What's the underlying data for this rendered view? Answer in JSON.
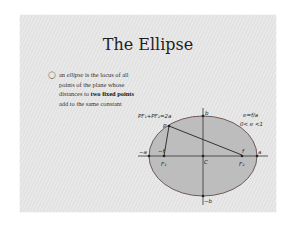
{
  "slide": {
    "title": "The Ellipse",
    "bullet": {
      "icon": "hollow-bullet",
      "text_parts": [
        {
          "t": "an ",
          "style": "normal"
        },
        {
          "t": "ellipse",
          "style": "italic"
        },
        {
          "t": " is the locus of all points of the plane whose distances to ",
          "style": "normal"
        },
        {
          "t": "two fixed points",
          "style": "bold"
        },
        {
          "t": " add to the same constant",
          "style": "normal"
        }
      ]
    },
    "diagram": {
      "formula_sum": "PF₁+PF₂=2a",
      "eccentricity": "e=f/a",
      "ecc_range": "0< e <1",
      "labels": {
        "b": "b",
        "neg_b": "−b",
        "a": "a",
        "neg_a": "−a",
        "f": "f",
        "neg_f": "−f",
        "P": "P",
        "F1": "F₁",
        "F2": "F₂",
        "C": "C"
      },
      "colors": {
        "fill": "#b9b9b9",
        "stroke": "#6e5a5a",
        "line": "#333333"
      }
    }
  }
}
